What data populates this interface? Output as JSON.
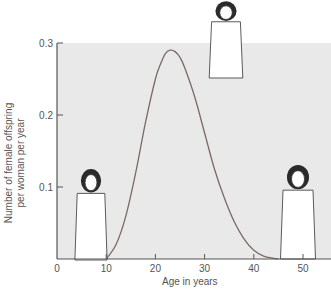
{
  "chart_data": {
    "type": "line",
    "title": "",
    "xlabel": "Age in years",
    "ylabel": [
      "Number of female offspring",
      "per woman per year"
    ],
    "xlim": [
      0,
      55
    ],
    "ylim": [
      0,
      0.3
    ],
    "xticks": [
      0,
      10,
      20,
      30,
      40,
      50
    ],
    "xtick_labels": [
      "0",
      "10",
      "20",
      "30",
      "40",
      "50"
    ],
    "yticks": [
      0.1,
      0.2,
      0.3
    ],
    "ytick_labels": [
      "0.1",
      "0.2",
      "0.3"
    ],
    "grid": false,
    "legend": null,
    "series": [
      {
        "name": "fecundity",
        "x": [
          10,
          12,
          14,
          16,
          18,
          20,
          21,
          22,
          23,
          24,
          25,
          26,
          28,
          30,
          32,
          34,
          36,
          38,
          40,
          42,
          44,
          45
        ],
        "y": [
          0,
          0.02,
          0.06,
          0.12,
          0.19,
          0.25,
          0.27,
          0.285,
          0.29,
          0.288,
          0.28,
          0.265,
          0.225,
          0.175,
          0.125,
          0.085,
          0.052,
          0.028,
          0.012,
          0.004,
          0.001,
          0
        ]
      }
    ],
    "annotations": [
      {
        "label": "young girl illustration",
        "near_x": 7
      },
      {
        "label": "mother nursing infant illustration",
        "near_x": 30
      },
      {
        "label": "older woman illustration",
        "near_x": 50
      }
    ],
    "colors": {
      "plot_background": "#e9e9e9",
      "line": "#7a6a66",
      "axis": "#555555"
    }
  }
}
